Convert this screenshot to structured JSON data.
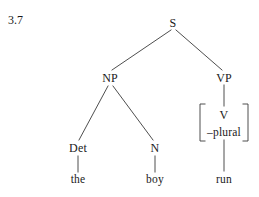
{
  "figure": {
    "number": "3.7"
  },
  "colors": {
    "background": "#ffffff",
    "ink": "#1a1a1a",
    "line": "#3a3a3a"
  },
  "tree": {
    "type": "syntax-tree",
    "nodes": [
      {
        "id": "s",
        "label": "S",
        "x": 173,
        "y": 23,
        "kind": "category"
      },
      {
        "id": "np",
        "label": "NP",
        "x": 110,
        "y": 78,
        "kind": "category"
      },
      {
        "id": "vp",
        "label": "VP",
        "x": 224,
        "y": 78,
        "kind": "category"
      },
      {
        "id": "det",
        "label": "Det",
        "x": 78,
        "y": 148,
        "kind": "category"
      },
      {
        "id": "n",
        "label": "N",
        "x": 155,
        "y": 148,
        "kind": "category"
      },
      {
        "id": "v",
        "label": "V",
        "x": 224,
        "y": 115,
        "kind": "category"
      },
      {
        "id": "plural",
        "label": "–plural",
        "x": 224,
        "y": 133,
        "kind": "feature"
      },
      {
        "id": "the",
        "label": "the",
        "x": 78,
        "y": 180,
        "kind": "terminal"
      },
      {
        "id": "boy",
        "label": "boy",
        "x": 155,
        "y": 180,
        "kind": "terminal"
      },
      {
        "id": "run",
        "label": "run",
        "x": 224,
        "y": 180,
        "kind": "terminal"
      }
    ],
    "edges": [
      {
        "from": "s",
        "to": "np",
        "x1": 171,
        "y1": 30,
        "x2": 112,
        "y2": 70
      },
      {
        "from": "s",
        "to": "vp",
        "x1": 176,
        "y1": 30,
        "x2": 222,
        "y2": 70
      },
      {
        "from": "np",
        "to": "det",
        "x1": 108,
        "y1": 86,
        "x2": 79,
        "y2": 140
      },
      {
        "from": "np",
        "to": "n",
        "x1": 113,
        "y1": 86,
        "x2": 153,
        "y2": 140
      },
      {
        "from": "vp",
        "to": "v",
        "x1": 224,
        "y1": 85,
        "x2": 224,
        "y2": 106
      },
      {
        "from": "det",
        "to": "the",
        "x1": 78,
        "y1": 156,
        "x2": 78,
        "y2": 172
      },
      {
        "from": "n",
        "to": "boy",
        "x1": 155,
        "y1": 156,
        "x2": 155,
        "y2": 172
      },
      {
        "from": "v",
        "to": "run",
        "x1": 224,
        "y1": 140,
        "x2": 224,
        "y2": 171
      }
    ],
    "bracket": {
      "contains": [
        "V",
        "–plural"
      ],
      "left_x": 200,
      "right_x": 248,
      "top_y": 104,
      "bottom_y": 141,
      "serif_width": 5
    }
  }
}
